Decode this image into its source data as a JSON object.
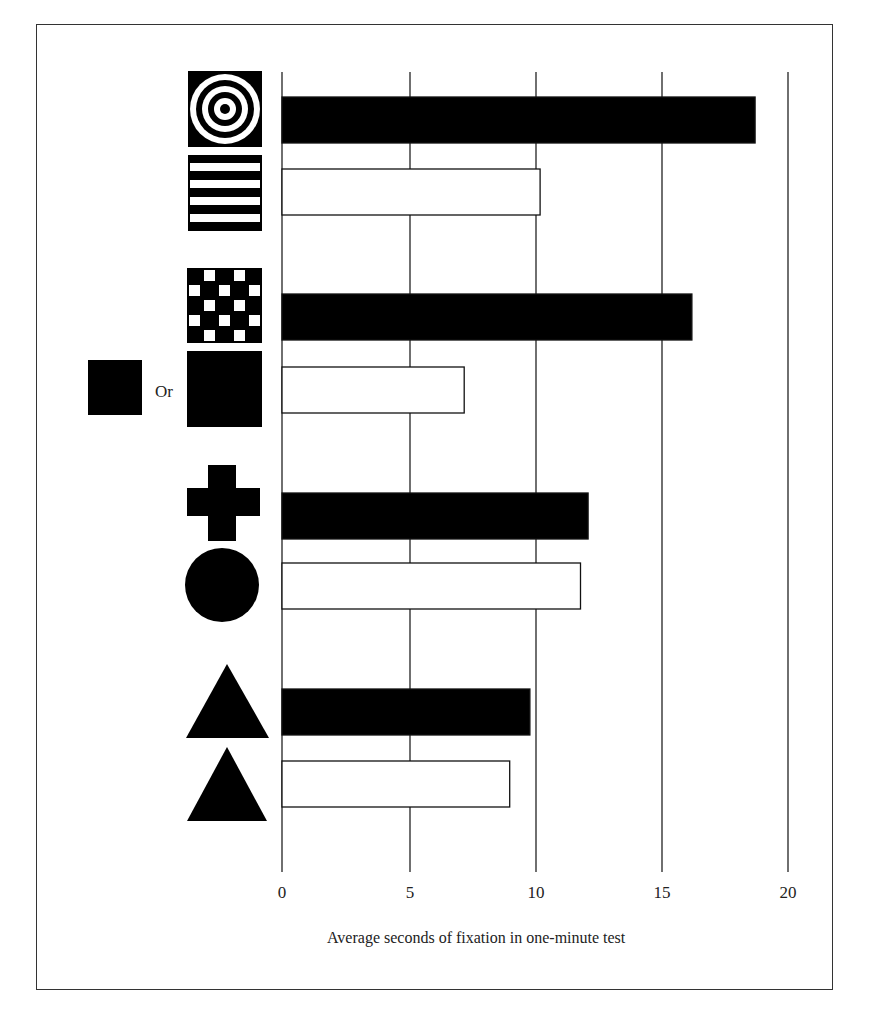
{
  "chart_data": {
    "type": "bar",
    "orientation": "horizontal",
    "title": "",
    "xlabel": "Average seconds of fixation in one-minute test",
    "ylabel": "",
    "xlim": [
      0,
      20
    ],
    "xticks": [
      0,
      5,
      10,
      15,
      20
    ],
    "grid": true,
    "categories": [
      "bullseye (concentric circles)",
      "horizontal stripes",
      "checkerboard",
      "solid square (Or)",
      "cross",
      "circle",
      "triangle (large)",
      "triangle (small)"
    ],
    "pairs": [
      {
        "stimuli": [
          "bullseye",
          "stripes"
        ],
        "values": [
          18.7,
          10.2
        ]
      },
      {
        "stimuli": [
          "checkerboard",
          "solid square"
        ],
        "values": [
          16.2,
          7.2
        ]
      },
      {
        "stimuli": [
          "cross",
          "circle"
        ],
        "values": [
          12.1,
          11.8
        ]
      },
      {
        "stimuli": [
          "triangle",
          "triangle"
        ],
        "values": [
          9.8,
          9.0
        ]
      }
    ],
    "values": [
      18.7,
      10.2,
      16.2,
      7.2,
      12.1,
      11.8,
      9.8,
      9.0
    ],
    "bar_fill": [
      "#000000",
      "#ffffff",
      "#000000",
      "#ffffff",
      "#000000",
      "#ffffff",
      "#000000",
      "#ffffff"
    ],
    "annotations": [
      "Or"
    ]
  },
  "labels": {
    "xlabel": "Average seconds of fixation in one-minute test",
    "or": "Or",
    "ticks": [
      "0",
      "5",
      "10",
      "15",
      "20"
    ]
  }
}
